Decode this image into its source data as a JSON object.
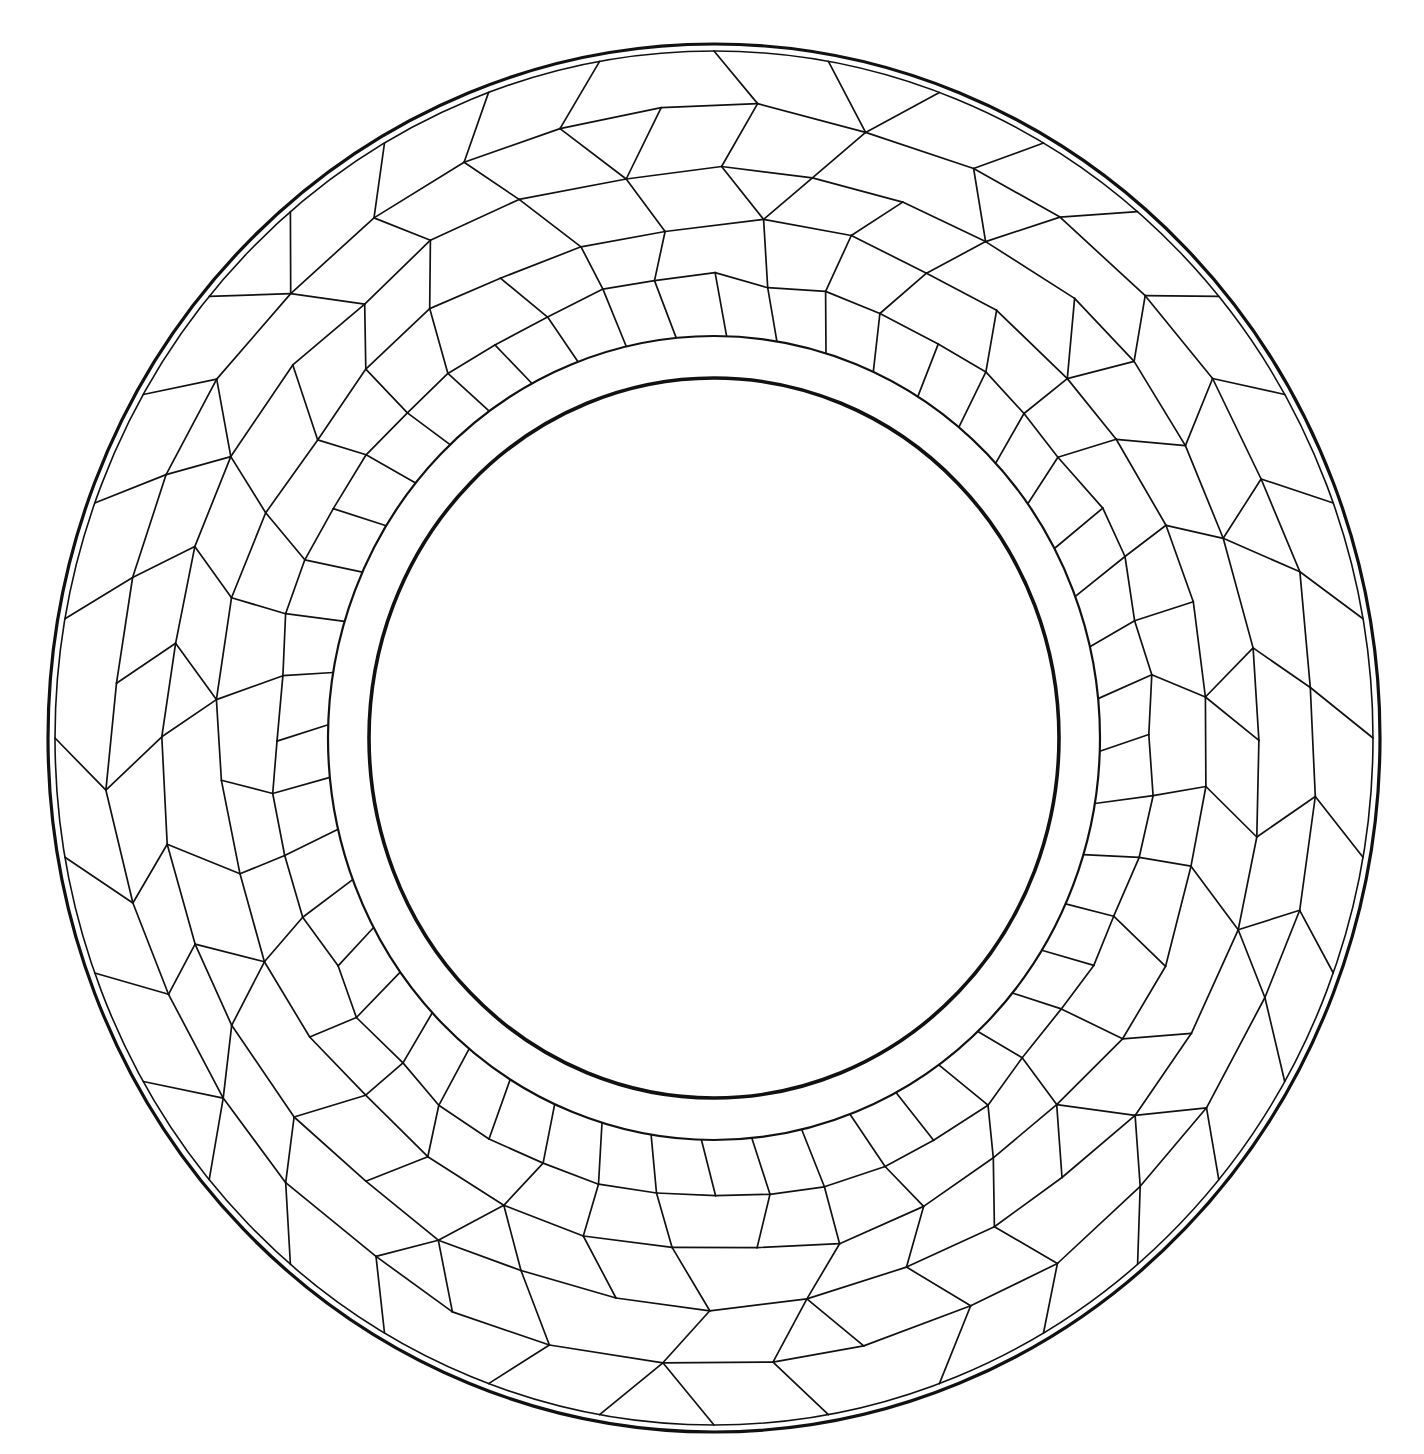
{
  "caption": "plate decoration — partially cropped heading",
  "figure": {
    "stroke_color": "#111111",
    "background": "#ffffff",
    "center": [
      714,
      738
    ],
    "outer_rim": {
      "outer": [
        666,
        694
      ],
      "inner": [
        659,
        687
      ],
      "outer_width": 3.2,
      "inner_width": 1.6
    },
    "band": {
      "radii": [
        386,
        402
      ],
      "width": 2.2
    },
    "inner_circle": {
      "radii": [
        345,
        360
      ],
      "width": 3.6
    },
    "cell_rings": [
      {
        "r_frac": 1.0,
        "count": 36,
        "offset": 0.0
      },
      {
        "r_frac": 0.8,
        "count": 36,
        "offset": 0.5
      },
      {
        "r_frac": 0.6,
        "count": 36,
        "offset": 0.0
      },
      {
        "r_frac": 0.4,
        "count": 36,
        "offset": 0.5
      },
      {
        "r_frac": 0.2,
        "count": 48,
        "offset": 0.0
      },
      {
        "r_frac": 0.0,
        "count": 48,
        "offset": 0.25
      }
    ],
    "cell_stroke_width": 1.7,
    "jitter": 0.18
  }
}
